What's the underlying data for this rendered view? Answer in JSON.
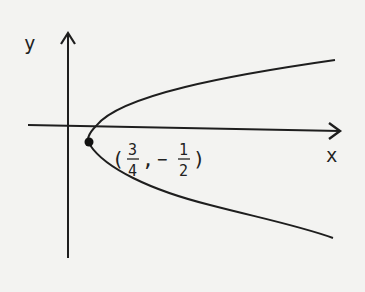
{
  "figure": {
    "axes": {
      "x_label": "x",
      "y_label": "y"
    },
    "curve": {
      "type": "parabola opening right",
      "vertex_label": {
        "open": "(",
        "x_num": "3",
        "x_den": "4",
        "sep": ",",
        "y_sign": "−",
        "y_num": "1",
        "y_den": "2",
        "close": ")"
      }
    },
    "colors": {
      "ink": "#1e1e1e",
      "paper": "#f3f3f1"
    }
  }
}
